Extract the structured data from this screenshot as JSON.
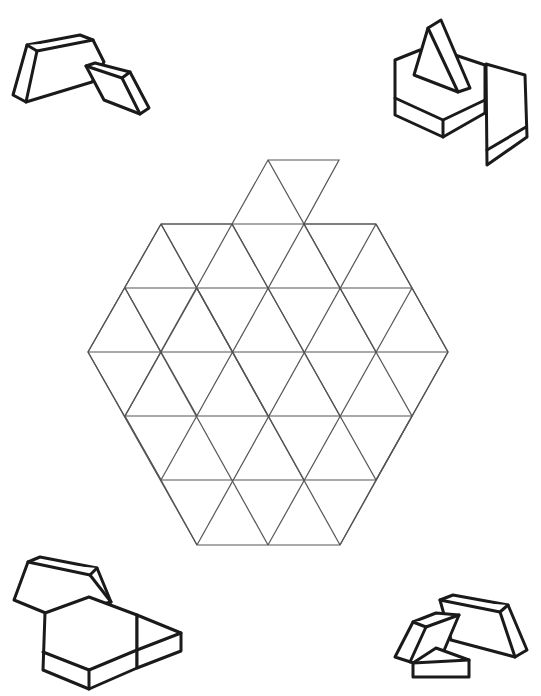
{
  "page": {
    "title": ""
  },
  "puzzle": {
    "shape": "apple",
    "unit": "equilateral-triangle",
    "side_px": 72,
    "rows": [
      {
        "y": 160,
        "x_left": 268,
        "x_right": 339,
        "note": "stem top"
      },
      {
        "y": 224,
        "x_left": 161,
        "x_right": 376
      },
      {
        "y": 288,
        "x_left": 125,
        "x_right": 412
      },
      {
        "y": 352,
        "x_left": 88,
        "x_right": 448
      },
      {
        "y": 416,
        "x_left": 125,
        "x_right": 412
      },
      {
        "y": 480,
        "x_left": 161,
        "x_right": 376
      },
      {
        "y": 545,
        "x_left": 197,
        "x_right": 340
      }
    ],
    "line_color": "#555555"
  },
  "decorations": [
    {
      "name": "pattern-blocks-top-left",
      "pieces": [
        "trapezoid",
        "rhombus"
      ]
    },
    {
      "name": "pattern-blocks-top-right",
      "pieces": [
        "hexagon",
        "triangle",
        "rhombus"
      ]
    },
    {
      "name": "pattern-blocks-bottom-left",
      "pieces": [
        "trapezoid",
        "hexagon",
        "triangle"
      ]
    },
    {
      "name": "pattern-blocks-bottom-right",
      "pieces": [
        "trapezoid",
        "rhombus",
        "triangle"
      ]
    }
  ]
}
